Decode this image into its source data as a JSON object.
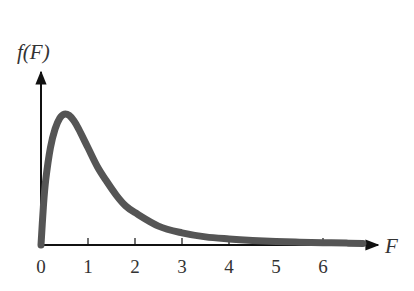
{
  "chart_data": {
    "type": "line",
    "title": "",
    "xlabel": "F",
    "ylabel": "f(F)",
    "x_ticks": [
      0,
      1,
      2,
      3,
      4,
      5,
      6
    ],
    "xlim": [
      0,
      7
    ],
    "ylim": [
      0,
      1
    ],
    "grid": false,
    "legend": null,
    "series": [
      {
        "name": "f(F)",
        "color": "#555555",
        "x": [
          0,
          0.05,
          0.1,
          0.2,
          0.3,
          0.4,
          0.5,
          0.6,
          0.7,
          0.8,
          1.0,
          1.2,
          1.4,
          1.6,
          1.8,
          2.0,
          2.5,
          3.0,
          3.5,
          4.0,
          4.5,
          5.0,
          5.5,
          6.0,
          6.5,
          6.85
        ],
        "y": [
          0,
          0.28,
          0.48,
          0.72,
          0.86,
          0.94,
          0.97,
          0.96,
          0.92,
          0.86,
          0.72,
          0.58,
          0.47,
          0.37,
          0.29,
          0.24,
          0.14,
          0.09,
          0.06,
          0.045,
          0.034,
          0.026,
          0.021,
          0.017,
          0.014,
          0.012
        ]
      }
    ]
  },
  "axes": {
    "x_axis_label": "F",
    "y_axis_label": "f(F)",
    "tick_labels": [
      "0",
      "1",
      "2",
      "3",
      "4",
      "5",
      "6"
    ]
  },
  "colors": {
    "curve": "#555555",
    "axis": "#111111",
    "text": "#333333"
  }
}
